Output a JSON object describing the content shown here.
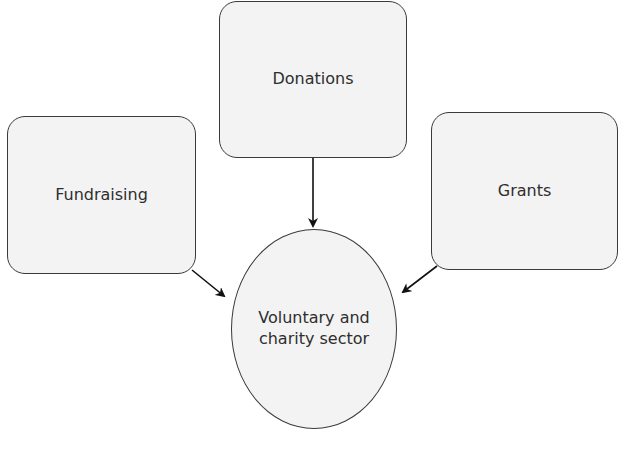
{
  "diagram": {
    "type": "flow",
    "nodes": [
      {
        "id": "fundraising",
        "label": "Fundraising",
        "shape": "rounded-rect"
      },
      {
        "id": "donations",
        "label": "Donations",
        "shape": "rounded-rect"
      },
      {
        "id": "grants",
        "label": "Grants",
        "shape": "rounded-rect"
      },
      {
        "id": "sector",
        "label_line1": "Voluntary and",
        "label_line2": "charity sector",
        "shape": "circle"
      }
    ],
    "edges": [
      {
        "from": "fundraising",
        "to": "sector"
      },
      {
        "from": "donations",
        "to": "sector"
      },
      {
        "from": "grants",
        "to": "sector"
      }
    ],
    "colors": {
      "node_fill": "#f3f3f3",
      "stroke": "#3a3a3a",
      "text": "#2e2e2e",
      "arrow": "#111111"
    }
  }
}
